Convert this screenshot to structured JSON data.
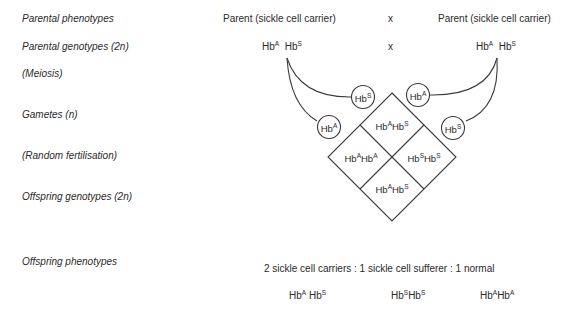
{
  "row_labels": {
    "parental_phenotypes": "Parental phenotypes",
    "parental_genotypes": "Parental genotypes (2n)",
    "meiosis": "(Meiosis)",
    "gametes": "Gametes (n)",
    "random_fertilisation": "(Random fertilisation)",
    "offspring_genotypes": "Offspring genotypes (2n)",
    "offspring_phenotypes": "Offspring phenotypes"
  },
  "parents": {
    "left_phenotype": "Parent  (sickle cell carrier)",
    "right_phenotype": "Parent  (sickle cell carrier)",
    "cross_symbol": "x",
    "left_genotype": [
      "A",
      "S"
    ],
    "right_genotype": [
      "A",
      "S"
    ]
  },
  "gametes": {
    "left_upper": "S",
    "left_lower": "A",
    "right_upper": "A",
    "right_lower": "S"
  },
  "punnett": {
    "top": [
      "A",
      "S"
    ],
    "left": [
      "A",
      "A"
    ],
    "right": [
      "S",
      "S"
    ],
    "bottom": [
      "A",
      "S"
    ]
  },
  "offspring": {
    "ratio_text": "2 sickle cell carriers  :  1 sickle cell sufferer  :  1 normal",
    "genotypes": [
      [
        "A",
        "S"
      ],
      [
        "S",
        "S"
      ],
      [
        "A",
        "A"
      ]
    ]
  },
  "symbols": {
    "base": "Hb"
  },
  "colors": {
    "line": "#3a3a3a",
    "text": "#2a2a2a",
    "background": "#ffffff"
  }
}
